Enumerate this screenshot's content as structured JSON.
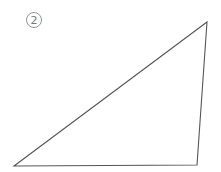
{
  "figure": {
    "label": "2",
    "label_circle": {
      "cx": 34,
      "cy": 20,
      "r": 7.5
    },
    "triangle": {
      "vertices": [
        {
          "name": "top-right",
          "x": 207,
          "y": 22
        },
        {
          "name": "bottom-left",
          "x": 14,
          "y": 166
        },
        {
          "name": "bottom-right",
          "x": 197,
          "y": 165
        }
      ],
      "stroke": "#555555"
    },
    "label_color": "#777777"
  }
}
